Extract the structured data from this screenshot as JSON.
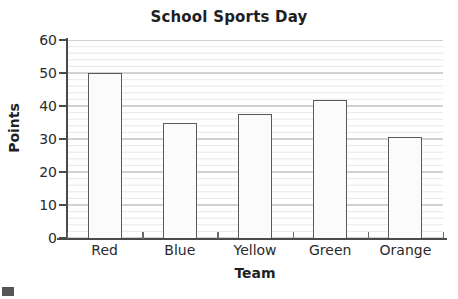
{
  "chart_data": {
    "type": "bar",
    "title": "School Sports Day",
    "xlabel": "Team",
    "ylabel": "Points",
    "categories": [
      "Red",
      "Blue",
      "Yellow",
      "Green",
      "Orange"
    ],
    "values": [
      50,
      34.8,
      37.6,
      41.8,
      30.5
    ],
    "ylim": [
      0,
      60
    ],
    "yticks": [
      0,
      10,
      20,
      30,
      40,
      50,
      60
    ],
    "ytick_labels": [
      "0",
      "10",
      "20",
      "30",
      "40",
      "50",
      "60"
    ],
    "minor_tick_step": 2,
    "grid": true,
    "grid_major_color": "#9a9a9a",
    "grid_minor_color": "#e0e0e0",
    "legend": null,
    "bar_fill": "#fbfbfb",
    "bar_edge": "#59595b",
    "axis_color": "#4a4a4a",
    "background": "#ffffff"
  },
  "artifact": {
    "name": "scan-artifact",
    "color": "#565656"
  }
}
